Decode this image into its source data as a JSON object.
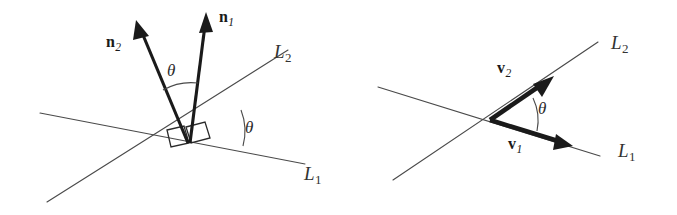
{
  "figure": {
    "caption": "",
    "background_color": "#ffffff",
    "stroke_color": "#4a4a4a",
    "vector_color": "#1a1a1a"
  },
  "panels": [
    {
      "id": "left-panel",
      "description": "Two intersecting lines with normal vectors n1 and n2 and angle theta",
      "lines": [
        {
          "name": "L1",
          "label": "L",
          "subscript": "1"
        },
        {
          "name": "L2",
          "label": "L",
          "subscript": "2"
        }
      ],
      "vectors": [
        {
          "name": "n1",
          "label": "n",
          "subscript": "1"
        },
        {
          "name": "n2",
          "label": "n",
          "subscript": "2"
        }
      ],
      "angles": [
        {
          "name": "theta-between-normals",
          "symbol": "θ"
        },
        {
          "name": "theta-between-lines",
          "symbol": "θ"
        }
      ],
      "right_angle_marks": 2
    },
    {
      "id": "right-panel",
      "description": "Two intersecting lines with direction vectors v1 and v2 and angle theta",
      "lines": [
        {
          "name": "L1",
          "label": "L",
          "subscript": "1"
        },
        {
          "name": "L2",
          "label": "L",
          "subscript": "2"
        }
      ],
      "vectors": [
        {
          "name": "v1",
          "label": "v",
          "subscript": "1"
        },
        {
          "name": "v2",
          "label": "v",
          "subscript": "2"
        }
      ],
      "angles": [
        {
          "name": "theta-between-vectors",
          "symbol": "θ"
        }
      ],
      "right_angle_marks": 0
    }
  ],
  "labels": {
    "left": {
      "n1_base": "n",
      "n1_sub": "1",
      "n2_base": "n",
      "n2_sub": "2",
      "L1_base": "L",
      "L1_sub": "1",
      "L2_base": "L",
      "L2_sub": "2",
      "theta_normals": "θ",
      "theta_lines": "θ"
    },
    "right": {
      "v1_base": "v",
      "v1_sub": "1",
      "v2_base": "v",
      "v2_sub": "2",
      "L1_base": "L",
      "L1_sub": "1",
      "L2_base": "L",
      "L2_sub": "2",
      "theta_vectors": "θ"
    }
  }
}
